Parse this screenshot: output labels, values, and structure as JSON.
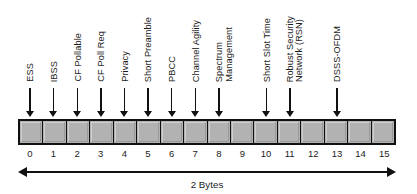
{
  "diagram": {
    "type": "bit-field",
    "total_bits": 16,
    "width_label": "2 Bytes",
    "cell_fill_color": "#b2b2b2",
    "line_color": "#111111",
    "bit_numbers": [
      "0",
      "1",
      "2",
      "3",
      "4",
      "5",
      "6",
      "7",
      "8",
      "9",
      "10",
      "11",
      "12",
      "13",
      "14",
      "15"
    ],
    "bit_labels": [
      {
        "bit": 0,
        "lines": [
          "ESS"
        ]
      },
      {
        "bit": 1,
        "lines": [
          "IBSS"
        ]
      },
      {
        "bit": 2,
        "lines": [
          "CF Pollable"
        ]
      },
      {
        "bit": 3,
        "lines": [
          "CF Poll Req"
        ]
      },
      {
        "bit": 4,
        "lines": [
          "Privacy"
        ]
      },
      {
        "bit": 5,
        "lines": [
          "Short Preamble"
        ]
      },
      {
        "bit": 6,
        "lines": [
          "PBCC"
        ]
      },
      {
        "bit": 7,
        "lines": [
          "Channel Agility"
        ]
      },
      {
        "bit": 8,
        "lines": [
          "Spectrum",
          "Management"
        ]
      },
      {
        "bit": 10,
        "lines": [
          "Short Slot Time"
        ]
      },
      {
        "bit": 11,
        "lines": [
          "Robust Security",
          "Network (RSN)"
        ]
      },
      {
        "bit": 13,
        "lines": [
          "DSSS-OFDM"
        ]
      }
    ],
    "unlabeled_bits": [
      9,
      12,
      14,
      15
    ]
  }
}
